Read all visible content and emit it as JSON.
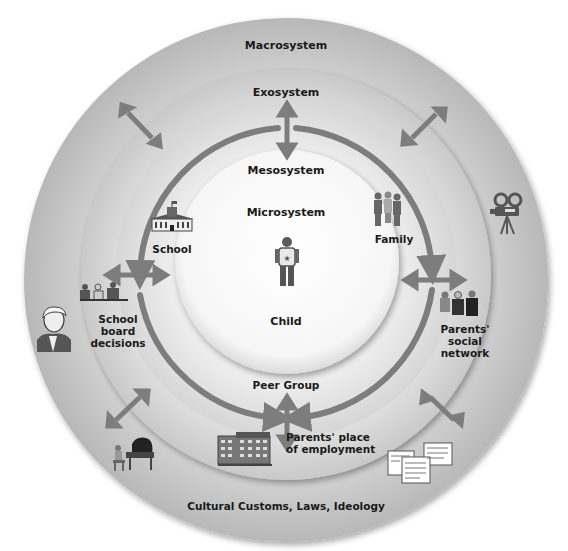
{
  "diagram": {
    "type": "concentric-systems",
    "layers": {
      "macrosystem": {
        "title": "Macrosystem",
        "caption": "Cultural Customs, Laws, Ideology"
      },
      "exosystem": {
        "title": "Exosystem"
      },
      "mesosystem": {
        "title": "Mesosystem"
      },
      "microsystem": {
        "title": "Microsystem",
        "center": "Child"
      }
    },
    "microsystem_nodes": [
      {
        "label": "School"
      },
      {
        "label": "Family"
      },
      {
        "label": "Peer Group"
      }
    ],
    "exosystem_nodes": [
      {
        "label_lines": [
          "School",
          "board",
          "decisions"
        ]
      },
      {
        "label_lines": [
          "Parents'",
          "social",
          "network"
        ]
      },
      {
        "label_lines": [
          "Parents' place",
          "of employment"
        ]
      }
    ],
    "icons": [
      "child-icon",
      "school-building-icon",
      "family-icon",
      "people-meeting-icon",
      "business-people-icon",
      "office-building-icon",
      "historical-figure-portrait-icon",
      "film-camera-icon",
      "piano-player-icon",
      "documents-icon"
    ],
    "colors": {
      "macro_ring": "#c8c8c8",
      "exo_ring": "#d6d6d6",
      "meso_ring": "#e2e2e2",
      "micro_circle": "#f7f7f7",
      "arrow": "#7d7d7d",
      "text": "#1a1a1a"
    }
  }
}
